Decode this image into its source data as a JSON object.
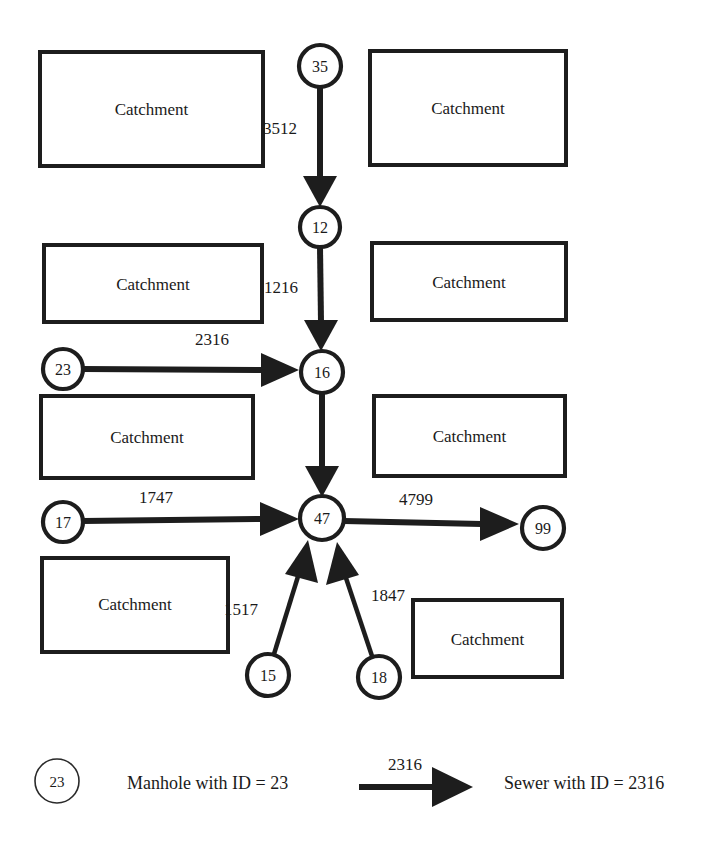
{
  "diagram": {
    "catchment_label": "Catchment",
    "catchments": [
      {
        "id": "catchment-top-left",
        "label": "Catchment",
        "x": 40,
        "y": 52,
        "w": 223,
        "h": 114
      },
      {
        "id": "catchment-top-right",
        "label": "Catchment",
        "x": 370,
        "y": 51,
        "w": 196,
        "h": 114
      },
      {
        "id": "catchment-mid-left",
        "label": "Catchment",
        "x": 44,
        "y": 245,
        "w": 218,
        "h": 77
      },
      {
        "id": "catchment-mid-right",
        "label": "Catchment",
        "x": 372,
        "y": 243,
        "w": 194,
        "h": 77
      },
      {
        "id": "catchment-row3-left",
        "label": "Catchment",
        "x": 41,
        "y": 396,
        "w": 212,
        "h": 82
      },
      {
        "id": "catchment-row3-right",
        "label": "Catchment",
        "x": 374,
        "y": 396,
        "w": 191,
        "h": 80
      },
      {
        "id": "catchment-bottom-left",
        "label": "Catchment",
        "x": 42,
        "y": 558,
        "w": 186,
        "h": 94
      },
      {
        "id": "catchment-bottom-right",
        "label": "Catchment",
        "x": 413,
        "y": 600,
        "w": 149,
        "h": 77
      }
    ],
    "manholes": [
      {
        "id": "manhole-35",
        "label": "35",
        "cx": 320,
        "cy": 66,
        "r": 21
      },
      {
        "id": "manhole-12",
        "label": "12",
        "cx": 320,
        "cy": 227,
        "r": 20
      },
      {
        "id": "manhole-23",
        "label": "23",
        "cx": 63,
        "cy": 369,
        "r": 20
      },
      {
        "id": "manhole-16",
        "label": "16",
        "cx": 322,
        "cy": 372,
        "r": 21
      },
      {
        "id": "manhole-17",
        "label": "17",
        "cx": 63,
        "cy": 522,
        "r": 20
      },
      {
        "id": "manhole-47",
        "label": "47",
        "cx": 322,
        "cy": 518,
        "r": 22
      },
      {
        "id": "manhole-99",
        "label": "99",
        "cx": 543,
        "cy": 528,
        "r": 21
      },
      {
        "id": "manhole-15",
        "label": "15",
        "cx": 268,
        "cy": 675,
        "r": 21
      },
      {
        "id": "manhole-18",
        "label": "18",
        "cx": 379,
        "cy": 677,
        "r": 21
      }
    ],
    "sewers": [
      {
        "id": "sewer-3512",
        "label": "3512",
        "from": "manhole-35",
        "to": "manhole-12",
        "label_x": 297,
        "label_y": 134,
        "anchor": "end"
      },
      {
        "id": "sewer-1216",
        "label": "1216",
        "from": "manhole-12",
        "to": "manhole-16",
        "label_x": 298,
        "label_y": 293,
        "anchor": "end"
      },
      {
        "id": "sewer-2316",
        "label": "2316",
        "from": "manhole-23",
        "to": "manhole-16",
        "label_x": 212,
        "label_y": 345,
        "anchor": "middle"
      },
      {
        "id": "sewer-1747",
        "label": "1747",
        "from": "manhole-17",
        "to": "manhole-47",
        "label_x": 156,
        "label_y": 503,
        "anchor": "middle"
      },
      {
        "id": "sewer-4799",
        "label": "4799",
        "from": "manhole-47",
        "to": "manhole-99",
        "label_x": 416,
        "label_y": 505,
        "anchor": "middle"
      },
      {
        "id": "sewer-1517",
        "label": "1517",
        "from": "manhole-15",
        "to": "manhole-47",
        "label_x": 258,
        "label_y": 615,
        "anchor": "end"
      },
      {
        "id": "sewer-1847",
        "label": "1847",
        "from": "manhole-18",
        "to": "manhole-47",
        "label_x": 371,
        "label_y": 601,
        "anchor": "start"
      }
    ]
  },
  "legend": {
    "manhole": {
      "node_label": "23",
      "description": "Manhole with ID = 23"
    },
    "sewer": {
      "edge_label": "2316",
      "description": "Sewer with ID = 2316"
    }
  },
  "colors": {
    "ink": "#1d1d1d",
    "paper": "#ffffff"
  }
}
